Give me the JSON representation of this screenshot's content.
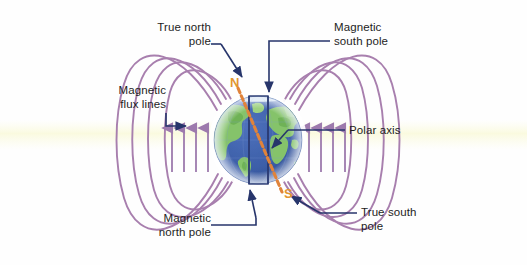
{
  "figure": {
    "background_color": "#fefefe",
    "haze_band_color": "#fbfbe8"
  },
  "labels": {
    "true_north_pole": "True north\npole",
    "magnetic_flux_lines": "Magnetic\nflux lines",
    "magnetic_south_pole": "Magnetic\nsouth pole",
    "polar_axis": "Polar axis",
    "magnetic_north_pole": "Magnetic\nnorth pole",
    "true_south_pole": "True south\npole"
  },
  "pole_markers": {
    "north": "N",
    "south": "S"
  },
  "colors": {
    "flux_line": "#a87fae",
    "leader_line": "#27356b",
    "label_text": "#1d1d1d",
    "pole_marker": "#e2962f",
    "magnetic_axis": "#e0833a",
    "ocean": "#3d5fa8",
    "land": "#86c46a",
    "polar_axis_rect": "#2a3a72",
    "arrow": "#9d7aad"
  },
  "globe": {
    "center_x": 258,
    "center_y": 140,
    "radius": 44
  },
  "flux_arrows": {
    "left_count": 4,
    "right_count": 4,
    "direction": "up"
  },
  "field_lines": {
    "arcs_per_side": 4
  }
}
